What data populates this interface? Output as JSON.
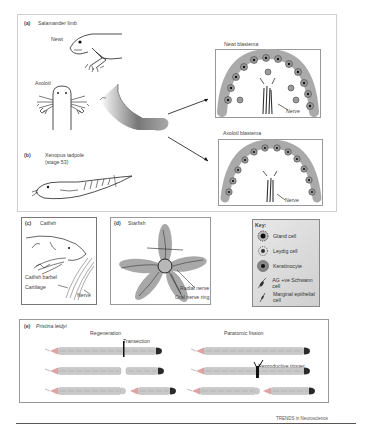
{
  "figure": {
    "source": "TRENDS in Neuroscience",
    "panels": {
      "a": {
        "letter": "(a)",
        "title": "Salamander limb",
        "labels": {
          "newt": "Newt",
          "axolotl": "Axolotl"
        },
        "blastemas": [
          {
            "title": "Newt blastema",
            "nerve_label": "Nerve"
          },
          {
            "title": "Axolotl blastema",
            "nerve_label": "Nerve"
          }
        ]
      },
      "b": {
        "letter": "(b)",
        "title_line1": "Xenopus tadpole",
        "title_line2": "(stage 53)"
      },
      "c": {
        "letter": "(c)",
        "title": "Catfish",
        "labels": {
          "barbel": "Catfish barbel",
          "cartilage": "Cartilage",
          "nerve": "Nerve"
        }
      },
      "d": {
        "letter": "(d)",
        "title": "Starfish",
        "labels": {
          "radial": "Radial nerve",
          "oral": "Oral nerve ring"
        }
      },
      "key": {
        "title": "Key:",
        "items": [
          {
            "icon": "gland-cell-icon",
            "label": "Gland cell"
          },
          {
            "icon": "leydig-cell-icon",
            "label": "Leydig cell"
          },
          {
            "icon": "keratinocyte-icon",
            "label": "Keratinocyte"
          },
          {
            "icon": "schwann-cell-icon",
            "label": "AG +ve Schwann cell"
          },
          {
            "icon": "marginal-epithelial-cell-icon",
            "label": "Marginal epithelial cell"
          }
        ]
      },
      "e": {
        "letter": "(e)",
        "title": "Pristina leidyi",
        "regeneration": {
          "title": "Regeneration",
          "annotation": "Transection"
        },
        "fission": {
          "title": "Paratomic fission",
          "annotation": "Reproductive trigger"
        }
      }
    },
    "colors": {
      "frame": "#cfcfcf",
      "worm_body": "#c9c9c9",
      "worm_head": "#e0a3a3",
      "worm_tail": "#2a2a2a",
      "starfish": "#a8a8a8",
      "key_bg": "#d8d8d8"
    }
  }
}
